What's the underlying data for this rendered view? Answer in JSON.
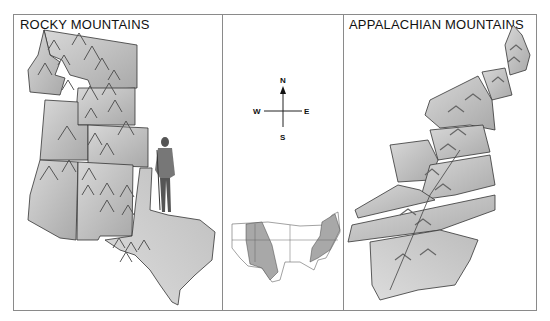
{
  "panels": {
    "left": {
      "title": "ROCKY MOUNTAINS"
    },
    "center": {
      "compass": {
        "north": "N",
        "south": "S",
        "east": "E",
        "west": "W"
      },
      "inset": "US map with Rocky and Appalachian regions shaded"
    },
    "right": {
      "title": "APPALACHIAN MOUNTAINS"
    }
  },
  "colors": {
    "border": "#8a8a8a",
    "state_fill": "#c9c9c9",
    "state_fill_dark": "#a8a8a8",
    "outline": "#222222",
    "mountain": "#7a7a7a"
  }
}
